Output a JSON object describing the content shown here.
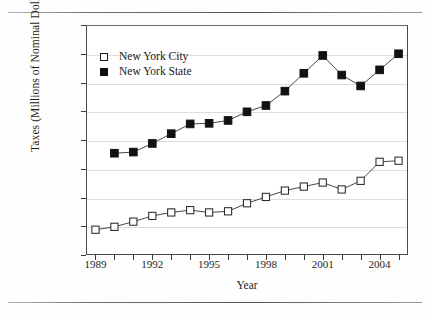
{
  "chart_data": {
    "type": "line",
    "title": "",
    "xlabel": "Year",
    "ylabel": "Taxes (Millions of Nominal Dollars)",
    "x": [
      1989,
      1990,
      1991,
      1992,
      1993,
      1994,
      1995,
      1996,
      1997,
      1998,
      1999,
      2000,
      2001,
      2002,
      2003,
      2004,
      2005
    ],
    "xlim": [
      1988.5,
      2005.5
    ],
    "ylim": [
      10000,
      50000
    ],
    "ytick_labels": [
      "10,000",
      "15,000",
      "20,000",
      "25,000",
      "30,000",
      "35,000",
      "40,000",
      "45,000",
      "50,000"
    ],
    "ytick_values": [
      10000,
      15000,
      20000,
      25000,
      30000,
      35000,
      40000,
      45000,
      50000
    ],
    "xtick_values": [
      1989,
      1990,
      1991,
      1992,
      1993,
      1994,
      1995,
      1996,
      1997,
      1998,
      1999,
      2000,
      2001,
      2002,
      2003,
      2004,
      2005
    ],
    "xtick_labels_shown": [
      "1989",
      "1992",
      "1995",
      "1998",
      "2001",
      "2004"
    ],
    "grid": "horizontal",
    "legend_position": "upper-left-inside",
    "series": [
      {
        "name": "New York City",
        "marker": "open-square",
        "color": "#1a1a1a",
        "values": [
          14400,
          14900,
          15800,
          16800,
          17400,
          17800,
          17400,
          17600,
          19000,
          20100,
          21200,
          21900,
          22600,
          21400,
          22900,
          26200,
          26400
        ]
      },
      {
        "name": "New York State",
        "marker": "filled-square",
        "color": "#111111",
        "values": [
          null,
          27700,
          27900,
          29400,
          31100,
          32800,
          32900,
          33400,
          34900,
          36000,
          38500,
          41600,
          44700,
          41300,
          39400,
          42200,
          45000
        ]
      }
    ]
  },
  "legend": {
    "items": [
      {
        "label": "New York City",
        "marker": "open-square"
      },
      {
        "label": "New York State",
        "marker": "filled-square"
      }
    ]
  },
  "axes": {
    "y_title": "Taxes (Millions of Nominal Dollars)",
    "x_title": "Year"
  }
}
